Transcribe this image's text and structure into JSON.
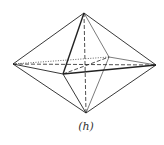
{
  "figure": {
    "caption": "(h)",
    "vertices": {
      "top": [
        84,
        13
      ],
      "bottom": [
        86,
        113
      ],
      "left": [
        13,
        64
      ],
      "right": [
        156,
        65
      ],
      "front": [
        63,
        74
      ],
      "back": [
        109,
        57
      ]
    },
    "edges": [
      {
        "from": "top",
        "to": "left",
        "style": "solid"
      },
      {
        "from": "top",
        "to": "right",
        "style": "solid"
      },
      {
        "from": "top",
        "to": "front",
        "style": "bold"
      },
      {
        "from": "top",
        "to": "back",
        "style": "thin"
      },
      {
        "from": "bottom",
        "to": "left",
        "style": "solid"
      },
      {
        "from": "bottom",
        "to": "right",
        "style": "solid"
      },
      {
        "from": "bottom",
        "to": "front",
        "style": "solid"
      },
      {
        "from": "bottom",
        "to": "back",
        "style": "thin"
      },
      {
        "from": "left",
        "to": "front",
        "style": "solid"
      },
      {
        "from": "front",
        "to": "right",
        "style": "bold"
      },
      {
        "from": "back",
        "to": "right",
        "style": "thin"
      },
      {
        "from": "left",
        "to": "back",
        "style": "dotted"
      },
      {
        "from": "left",
        "to": "right",
        "style": "dashed"
      },
      {
        "from": "front",
        "to": "back",
        "style": "dashed"
      },
      {
        "from": "top",
        "to": "bottom",
        "style": "dashed"
      }
    ],
    "stroke_color": "#222222"
  }
}
